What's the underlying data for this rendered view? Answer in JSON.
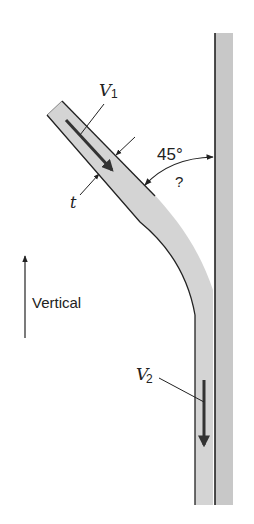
{
  "figure": {
    "labels": {
      "v1": "V",
      "v1_sub": "1",
      "v2": "V",
      "v2_sub": "2",
      "thickness": "t",
      "angle": "45°",
      "unknown_angle": "?",
      "vertical": "Vertical"
    },
    "colors": {
      "jet_fill": "#d4d4d4",
      "wall_fill": "#c8c8c8",
      "outline": "#222222",
      "arrow": "#333333"
    }
  }
}
